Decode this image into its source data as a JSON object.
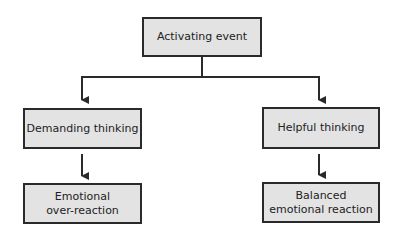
{
  "diagram": {
    "type": "flowchart",
    "colors": {
      "box_fill": "#e3e3e3",
      "box_border": "#2a2a2a",
      "line": "#2a2a2a"
    },
    "nodes": {
      "activating": {
        "lines": [
          "Activating event"
        ]
      },
      "demanding": {
        "lines": [
          "Demanding thinking"
        ]
      },
      "helpful": {
        "lines": [
          "Helpful thinking"
        ]
      },
      "overreaction": {
        "lines": [
          "Emotional",
          "over-reaction"
        ]
      },
      "balanced": {
        "lines": [
          "Balanced",
          "emotional reaction"
        ]
      }
    },
    "edges": [
      {
        "from": "Activating event",
        "to": "Demanding thinking"
      },
      {
        "from": "Activating event",
        "to": "Helpful thinking"
      },
      {
        "from": "Demanding thinking",
        "to": "Emotional over-reaction"
      },
      {
        "from": "Helpful thinking",
        "to": "Balanced emotional reaction"
      }
    ]
  }
}
